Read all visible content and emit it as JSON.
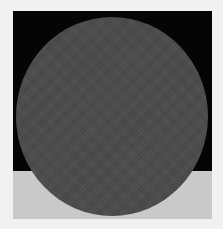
{
  "image": {
    "description": "Dark grey dithered circle over a square panel split into black (top) and light grey (bottom)",
    "colors": {
      "page_background": "#f1f1f1",
      "panel_top": "#050505",
      "panel_bottom": "#c9c9c9",
      "circle": "#4b4b4b"
    },
    "shapes": [
      {
        "type": "rect",
        "name": "panel-top",
        "x": 13,
        "y": 11,
        "w": 199,
        "h": 160,
        "fill": "#050505"
      },
      {
        "type": "rect",
        "name": "panel-bottom",
        "x": 13,
        "y": 171,
        "w": 199,
        "h": 48,
        "fill": "#c9c9c9"
      },
      {
        "type": "ellipse",
        "name": "circle",
        "cx": 112,
        "cy": 116,
        "rx": 96,
        "ry": 99,
        "fill": "#4b4b4b"
      }
    ]
  }
}
